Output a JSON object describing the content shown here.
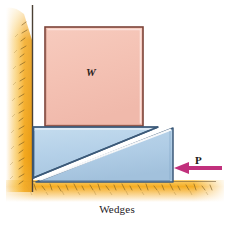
{
  "figure": {
    "caption": "Wedges",
    "labels": {
      "weight": "W",
      "force": "P"
    },
    "icons": {
      "force_arrow": "left-arrow-icon",
      "wall_hatching": "hatch-wall-icon",
      "ground_hatching": "hatch-ground-icon"
    },
    "colors": {
      "block_fill": "#f5c3b5",
      "block_edge": "#7c4338",
      "block_highlight": "#fbe3dc",
      "wedge_fill": "#b6d2e9",
      "wedge_fill_dark": "#a6c4de",
      "wedge_edge": "#3c5a79",
      "wedge_highlight": "#ffffff",
      "arrow": "#c1307c",
      "ground": "#f4a81f",
      "ground_light": "#fbcf68",
      "wall_line": "#4b4034",
      "caption_text": "#23201e"
    },
    "elements": {
      "block_name": "weight-block",
      "upper_wedge_name": "upper-wedge",
      "lower_wedge_name": "lower-wedge",
      "wall_name": "vertical-wall",
      "ground_name": "ground-surface"
    }
  }
}
